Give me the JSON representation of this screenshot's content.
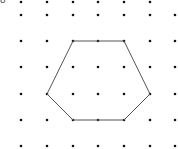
{
  "diagram": {
    "type": "dot-grid-polygon",
    "cropped_label": "8",
    "grid": {
      "columns_x": [
        21,
        47,
        73,
        98,
        124,
        150,
        175
      ],
      "rows": [
        {
          "y": 2,
          "x": [
            21,
            47,
            73,
            98,
            124,
            150
          ]
        },
        {
          "y": 15,
          "x": [
            21,
            47,
            73,
            98,
            124,
            150,
            175
          ]
        },
        {
          "y": 41,
          "x": [
            21,
            47,
            73,
            98,
            124,
            150,
            175
          ]
        },
        {
          "y": 67,
          "x": [
            21,
            47,
            73,
            98,
            124,
            150,
            175
          ]
        },
        {
          "y": 94,
          "x": [
            21,
            47,
            73,
            98,
            124,
            150,
            175
          ]
        },
        {
          "y": 120,
          "x": [
            21,
            47,
            73,
            98,
            124,
            150,
            175
          ]
        },
        {
          "y": 146,
          "x": [
            21,
            47,
            73,
            98,
            124,
            150,
            175
          ]
        }
      ],
      "dot_color": "#111111",
      "dot_radius": 1.3
    },
    "shape": {
      "name": "hexagon",
      "vertices": [
        [
          73,
          41
        ],
        [
          124,
          41
        ],
        [
          150,
          94
        ],
        [
          124,
          120
        ],
        [
          73,
          120
        ],
        [
          47,
          94
        ]
      ],
      "stroke": "#555555",
      "stroke_width": 1
    }
  }
}
